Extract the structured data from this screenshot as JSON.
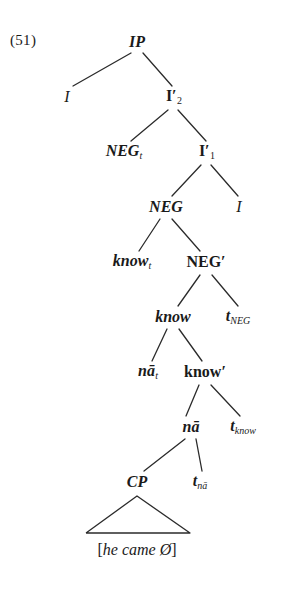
{
  "figure": {
    "example_number": "(51)",
    "type": "syntax-tree"
  },
  "tree": {
    "nodes": [
      {
        "id": "ip",
        "label": "IP",
        "sub": "",
        "style": "bold-italic",
        "x": 137,
        "y": 42
      },
      {
        "id": "i-spec",
        "label": "I",
        "sub": "",
        "style": "italic",
        "x": 67,
        "y": 97
      },
      {
        "id": "ibar2",
        "label": "I′",
        "sub": "2",
        "style": "bold-upright",
        "x": 174,
        "y": 97
      },
      {
        "id": "neg-t",
        "label": "NEG",
        "sub": "t",
        "style": "bold-italic",
        "x": 124,
        "y": 152
      },
      {
        "id": "ibar1",
        "label": "I′",
        "sub": "1",
        "style": "bold-upright",
        "x": 207,
        "y": 152
      },
      {
        "id": "neg",
        "label": "NEG",
        "sub": "",
        "style": "bold-italic",
        "x": 166,
        "y": 207
      },
      {
        "id": "i-head",
        "label": "I",
        "sub": "",
        "style": "italic",
        "x": 239,
        "y": 207
      },
      {
        "id": "know-t",
        "label": "know",
        "sub": "t",
        "style": "bold-italic",
        "x": 132,
        "y": 262
      },
      {
        "id": "negbar",
        "label": "NEG′",
        "sub": "",
        "style": "bold-upright",
        "x": 206,
        "y": 262
      },
      {
        "id": "know",
        "label": "know",
        "sub": "",
        "style": "bold-italic",
        "x": 173,
        "y": 317
      },
      {
        "id": "t-neg",
        "label": "t",
        "sub": "NEG",
        "style": "bold-italic",
        "x": 238,
        "y": 317
      },
      {
        "id": "na-t",
        "label": "nā",
        "sub": "t",
        "style": "bold-italic",
        "x": 148,
        "y": 372
      },
      {
        "id": "knowbar",
        "label": "know′",
        "sub": "",
        "style": "bold-upright",
        "x": 205,
        "y": 372
      },
      {
        "id": "na",
        "label": "nā",
        "sub": "",
        "style": "bold-italic",
        "x": 191,
        "y": 427
      },
      {
        "id": "t-know",
        "label": "t",
        "sub": "know",
        "style": "bold-italic",
        "x": 243,
        "y": 427
      },
      {
        "id": "cp",
        "label": "CP",
        "sub": "",
        "style": "bold-italic",
        "x": 137,
        "y": 482
      },
      {
        "id": "t-na",
        "label": "t",
        "sub": "nā",
        "style": "bold-italic",
        "x": 200,
        "y": 482
      }
    ],
    "branches": [
      {
        "from": "ip",
        "to": "i-spec",
        "x1": 131,
        "y1": 53,
        "x2": 73,
        "y2": 86
      },
      {
        "from": "ip",
        "to": "ibar2",
        "x1": 143,
        "y1": 53,
        "x2": 172,
        "y2": 86
      },
      {
        "from": "ibar2",
        "to": "neg-t",
        "x1": 168,
        "y1": 110,
        "x2": 131,
        "y2": 141
      },
      {
        "from": "ibar2",
        "to": "ibar1",
        "x1": 178,
        "y1": 110,
        "x2": 206,
        "y2": 141
      },
      {
        "from": "ibar1",
        "to": "neg",
        "x1": 201,
        "y1": 165,
        "x2": 172,
        "y2": 196
      },
      {
        "from": "ibar1",
        "to": "i-head",
        "x1": 211,
        "y1": 165,
        "x2": 238,
        "y2": 196
      },
      {
        "from": "neg",
        "to": "know-t",
        "x1": 160,
        "y1": 219,
        "x2": 139,
        "y2": 251
      },
      {
        "from": "neg",
        "to": "negbar",
        "x1": 172,
        "y1": 219,
        "x2": 200,
        "y2": 251
      },
      {
        "from": "negbar",
        "to": "know",
        "x1": 200,
        "y1": 275,
        "x2": 178,
        "y2": 306
      },
      {
        "from": "negbar",
        "to": "t-neg",
        "x1": 212,
        "y1": 275,
        "x2": 238,
        "y2": 306
      },
      {
        "from": "know",
        "to": "na-t",
        "x1": 167,
        "y1": 329,
        "x2": 152,
        "y2": 361
      },
      {
        "from": "know",
        "to": "knowbar",
        "x1": 179,
        "y1": 329,
        "x2": 202,
        "y2": 361
      },
      {
        "from": "knowbar",
        "to": "na",
        "x1": 199,
        "y1": 385,
        "x2": 186,
        "y2": 416
      },
      {
        "from": "knowbar",
        "to": "t-know",
        "x1": 211,
        "y1": 385,
        "x2": 240,
        "y2": 416
      },
      {
        "from": "na",
        "to": "cp",
        "x1": 185,
        "y1": 439,
        "x2": 144,
        "y2": 471
      },
      {
        "from": "na",
        "to": "t-na",
        "x1": 196,
        "y1": 439,
        "x2": 202,
        "y2": 471
      }
    ],
    "triangle": {
      "apex_x": 137,
      "apex_y": 496,
      "left_x": 86,
      "right_x": 190,
      "base_y": 533
    },
    "terminal": {
      "open_bracket": "[",
      "text": "he came Ø",
      "close_bracket": "]",
      "x": 137,
      "y": 550
    }
  },
  "colors": {
    "ink": "#1a1a1a",
    "line": "#2b2b2b",
    "background": "#ffffff"
  }
}
